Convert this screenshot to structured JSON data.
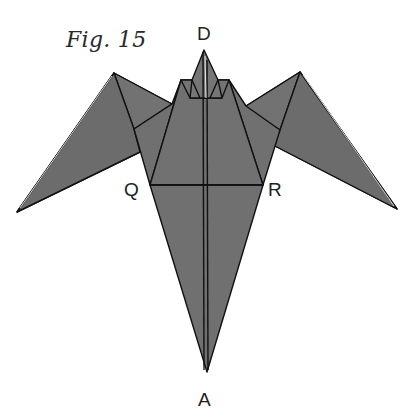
{
  "figure": {
    "caption": "Fig. 15",
    "labels": {
      "top": "D",
      "left": "Q",
      "right": "R",
      "bottom": "A"
    },
    "colors": {
      "paper_fill": "#6f6f6f",
      "paper_fill_light": "#7a7a7a",
      "crease_line": "#111111",
      "highlight_edge": "#d8d8d8",
      "background": "#ffffff"
    }
  }
}
